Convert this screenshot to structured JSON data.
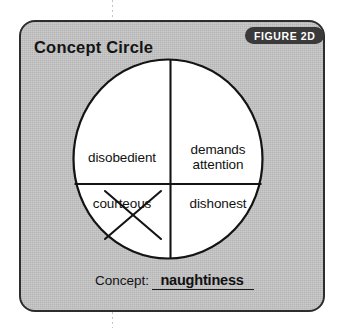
{
  "worksheet": {
    "title": "Concept Circle",
    "figure_badge": "FIGURE 2D",
    "card_color": "#c2c2c2",
    "border_color": "#2d2d2d",
    "badge_color": "#3a3a3a",
    "ink_color": "#111111"
  },
  "circle": {
    "quadrants": [
      {
        "position": "top-left",
        "label": "disobedient",
        "crossed_out": false
      },
      {
        "position": "top-right",
        "label": "demands\nattention",
        "line1": "demands",
        "line2": "attention",
        "crossed_out": false
      },
      {
        "position": "bottom-left",
        "label": "courteous",
        "crossed_out": true
      },
      {
        "position": "bottom-right",
        "label": "dishonest",
        "crossed_out": false
      }
    ]
  },
  "concept": {
    "label": "Concept:",
    "answer": "naughtiness"
  }
}
